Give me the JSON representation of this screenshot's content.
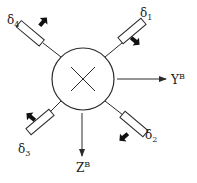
{
  "diagram": {
    "title": "",
    "center_symbol": "×",
    "axes": {
      "y": {
        "label": "Y",
        "superscript": "B"
      },
      "z": {
        "label": "Z",
        "superscript": "B"
      }
    },
    "fins": [
      {
        "id": "delta1",
        "label": "δ",
        "subscript": "1",
        "position": "top-right"
      },
      {
        "id": "delta2",
        "label": "δ",
        "subscript": "2",
        "position": "bottom-right"
      },
      {
        "id": "delta3",
        "label": "δ",
        "subscript": "3",
        "position": "bottom-left"
      },
      {
        "id": "delta4",
        "label": "δ",
        "subscript": "4",
        "position": "top-left"
      }
    ],
    "colors": {
      "stroke": "#2a2a2a",
      "background": "#ffffff"
    }
  }
}
